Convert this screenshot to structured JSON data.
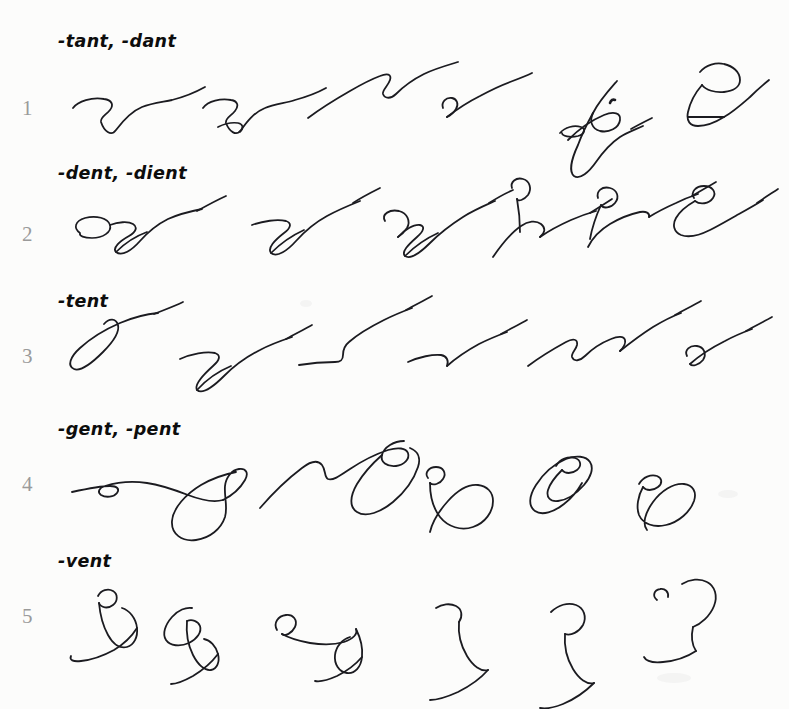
{
  "page": {
    "background_color": "#fcfcfb",
    "ink_color": "#1b1b20",
    "number_color": "#9a9a9a",
    "heading_color": "#0d0d0d",
    "width": 789,
    "height": 709
  },
  "rows": [
    {
      "number": "1",
      "heading": "-tant, -dant",
      "outline_count": 6,
      "outline_names": [
        "outline-tant-1",
        "outline-tant-2",
        "outline-tant-3",
        "outline-tant-4",
        "outline-tant-5",
        "outline-tant-6"
      ]
    },
    {
      "number": "2",
      "heading": "-dent, -dient",
      "outline_count": 6,
      "outline_names": [
        "outline-dent-1",
        "outline-dent-2",
        "outline-dent-3",
        "outline-dent-4",
        "outline-dent-5",
        "outline-dent-6"
      ]
    },
    {
      "number": "3",
      "heading": "-tent",
      "outline_count": 6,
      "outline_names": [
        "outline-tent-1",
        "outline-tent-2",
        "outline-tent-3",
        "outline-tent-4",
        "outline-tent-5",
        "outline-tent-6"
      ]
    },
    {
      "number": "4",
      "heading": "-gent, -pent",
      "outline_count": 5,
      "outline_names": [
        "outline-gent-1",
        "outline-gent-2",
        "outline-gent-3",
        "outline-gent-4",
        "outline-gent-5"
      ]
    },
    {
      "number": "5",
      "heading": "-vent",
      "outline_count": 6,
      "outline_names": [
        "outline-vent-1",
        "outline-vent-2",
        "outline-vent-3",
        "outline-vent-4",
        "outline-vent-5",
        "outline-vent-6"
      ]
    }
  ]
}
